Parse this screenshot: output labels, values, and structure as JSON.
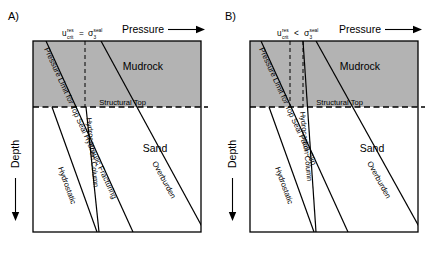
{
  "figure": {
    "type": "two-panel-schematic"
  },
  "panels": [
    {
      "id": "A",
      "letter": "A)",
      "criterion": {
        "lhs_base": "u",
        "lhs_sub": "crit",
        "lhs_sup": "res",
        "operator": "=",
        "rhs_base": "σ",
        "rhs_sub": "3",
        "rhs_sup": "seal"
      },
      "axis_x_label": "Pressure",
      "axis_y_label": "Depth",
      "region_upper": "Mudrock",
      "region_lower": "Sand",
      "boundary_label": "Structural Top",
      "lines": [
        {
          "name": "pressure-limit",
          "label": "Pressure Limit for Top Seal Hydraulic Fracturing"
        },
        {
          "name": "hydrocarbon-column",
          "label": "Hydrocarbon Column"
        },
        {
          "name": "hydrostatic",
          "label": "Hydrostatic"
        },
        {
          "name": "overburden",
          "label": "Overburden"
        }
      ]
    },
    {
      "id": "B",
      "letter": "B)",
      "criterion": {
        "lhs_base": "u",
        "lhs_sub": "crit",
        "lhs_sup": "res",
        "operator": "<",
        "rhs_base": "σ",
        "rhs_sub": "3",
        "rhs_sup": "seal"
      },
      "axis_x_label": "Pressure",
      "axis_y_label": "Depth",
      "region_upper": "Mudrock",
      "region_lower": "Sand",
      "boundary_label": "Structural Top",
      "lines": [
        {
          "name": "pressure-limit",
          "label": "Pressure Limit for Top Seal Fault Slip"
        },
        {
          "name": "hydrocarbon-column",
          "label": "Hydrocarbon Column"
        },
        {
          "name": "hydrostatic",
          "label": "Hydrostatic"
        },
        {
          "name": "overburden",
          "label": "Overburden"
        }
      ]
    }
  ],
  "colors": {
    "mudrock_fill": "#b3b3b3",
    "sand_fill": "#ffffff",
    "line": "#000000",
    "frame": "#000000"
  }
}
